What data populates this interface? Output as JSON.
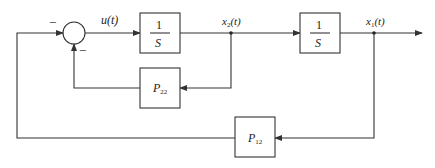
{
  "diagram": {
    "type": "block-diagram",
    "signals": {
      "u": "u(t)",
      "x2": "x",
      "x2_sub": "2",
      "x1": "x",
      "x1_sub": "1",
      "arg": "(t)"
    },
    "summing_junction": {
      "sign_top_left": "−",
      "sign_bottom": "−"
    },
    "blocks": [
      {
        "id": "integrator-1",
        "num": "1",
        "den": "S"
      },
      {
        "id": "integrator-2",
        "num": "1",
        "den": "S"
      },
      {
        "id": "gain-p22",
        "label": "P",
        "sub": "22"
      },
      {
        "id": "gain-p12",
        "label": "P",
        "sub": "12"
      }
    ]
  }
}
